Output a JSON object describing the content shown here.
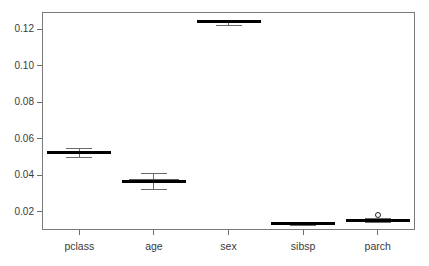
{
  "chart_data": {
    "type": "box",
    "title": "",
    "subtitle": "",
    "xlabel": "",
    "ylabel": "",
    "categories": [
      "pclass",
      "age",
      "sex",
      "sibsp",
      "parch"
    ],
    "ylim": [
      0.01,
      0.1295
    ],
    "yticks": [
      0.02,
      0.04,
      0.06,
      0.08,
      0.1,
      0.12
    ],
    "ytick_labels": [
      "0.02",
      "0.04",
      "0.06",
      "0.08",
      "0.10",
      "0.12"
    ],
    "grid": false,
    "legend": null,
    "boxes": [
      {
        "name": "pclass",
        "whisker_low": 0.05,
        "q1": 0.0515,
        "median": 0.0525,
        "q3": 0.0535,
        "whisker_high": 0.0551,
        "outliers": []
      },
      {
        "name": "age",
        "whisker_low": 0.0325,
        "q1": 0.0358,
        "median": 0.0368,
        "q3": 0.0379,
        "whisker_high": 0.0415,
        "outliers": []
      },
      {
        "name": "sex",
        "whisker_low": 0.1222,
        "q1": 0.1238,
        "median": 0.1243,
        "q3": 0.125,
        "whisker_high": 0.1253,
        "outliers": []
      },
      {
        "name": "sibsp",
        "whisker_low": 0.0126,
        "q1": 0.013,
        "median": 0.0134,
        "q3": 0.0138,
        "whisker_high": 0.0142,
        "outliers": []
      },
      {
        "name": "parch",
        "whisker_low": 0.0143,
        "q1": 0.0148,
        "median": 0.0152,
        "q3": 0.0157,
        "whisker_high": 0.0167,
        "outliers": [
          0.018
        ]
      }
    ]
  },
  "axes": {
    "frame_color": "#7a7a7a",
    "tick_color": "#6e6e6e",
    "label_color": "#3a3a3a"
  },
  "series_style": {
    "box_fill": "#fdfdfd",
    "box_stroke": "#5a5a5a",
    "median_color": "#000000",
    "whisker_color": "#6a6a6a",
    "outlier_color": "#222222"
  }
}
